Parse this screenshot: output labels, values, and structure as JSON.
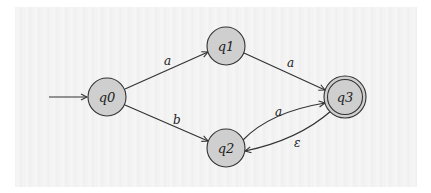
{
  "diagram": {
    "type": "finite-automaton",
    "colors": {
      "background": "#f3f3f3",
      "node_fill": "#cfcfcf",
      "stroke": "#333333"
    },
    "states": [
      {
        "id": "q0",
        "label": "q0",
        "initial": true,
        "accepting": false
      },
      {
        "id": "q1",
        "label": "q1",
        "initial": false,
        "accepting": false
      },
      {
        "id": "q2",
        "label": "q2",
        "initial": false,
        "accepting": false
      },
      {
        "id": "q3",
        "label": "q3",
        "initial": false,
        "accepting": true
      }
    ],
    "transitions": [
      {
        "from": "q0",
        "to": "q1",
        "label": "a"
      },
      {
        "from": "q0",
        "to": "q2",
        "label": "b"
      },
      {
        "from": "q1",
        "to": "q3",
        "label": "a"
      },
      {
        "from": "q2",
        "to": "q3",
        "label": "a"
      },
      {
        "from": "q3",
        "to": "q2",
        "label": "ε"
      }
    ]
  }
}
